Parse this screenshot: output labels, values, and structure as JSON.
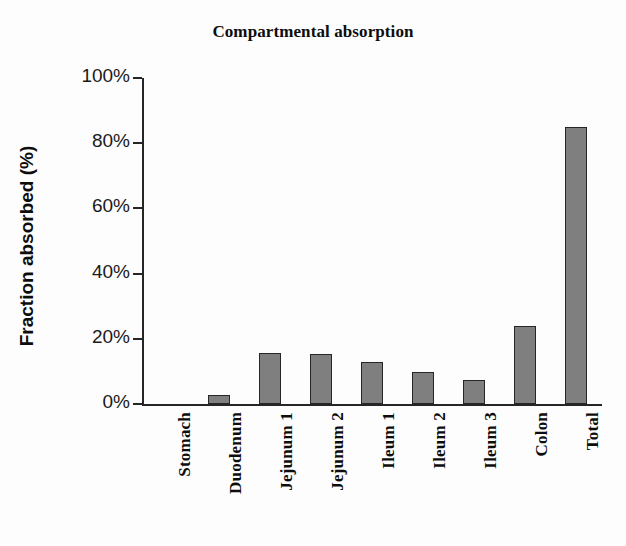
{
  "chart_data": {
    "type": "bar",
    "title": "Compartmental absorption",
    "xlabel": "",
    "ylabel": "Fraction absorbed (%)",
    "categories": [
      "Stomach",
      "Duodenum",
      "Jejunum 1",
      "Jejunum 2",
      "Ileum 1",
      "Ileum 2",
      "Ileum 3",
      "Colon",
      "Total"
    ],
    "values": [
      0,
      2.7,
      15.5,
      15.2,
      12.8,
      9.8,
      7.4,
      24,
      85
    ],
    "ylim": [
      0,
      100
    ],
    "ytick_labels": [
      "100%",
      "80%",
      "60%",
      "40%",
      "20%",
      "0%"
    ],
    "ytick_values": [
      100,
      80,
      60,
      40,
      20,
      0
    ],
    "grid": false,
    "legend": "none",
    "bar_fill_color": "#7f7f7f",
    "bar_edge_color": "#262626",
    "axis_color": "#262626",
    "background_color": "#ffffff"
  }
}
